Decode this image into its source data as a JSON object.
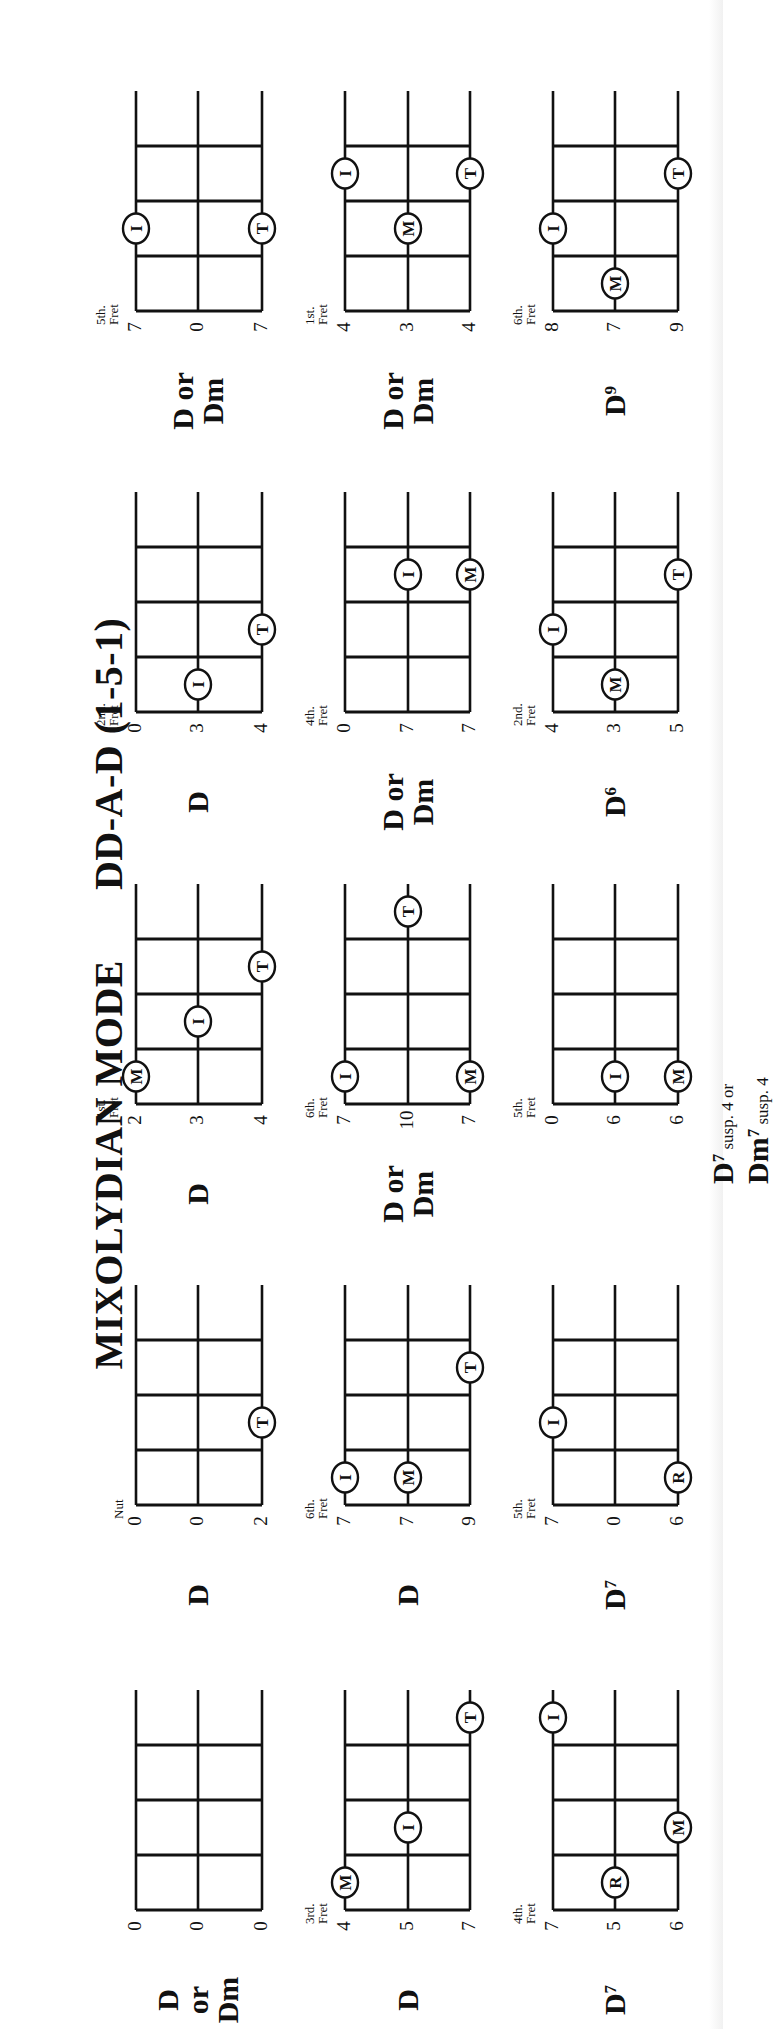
{
  "page": {
    "title_left": "MIXOLYDIAN MODE",
    "title_right": "DD-A-D (1-5-1)",
    "orientation": "rotated-90-ccw"
  },
  "legend": {
    "I": "Index finger",
    "M": "Middle finger",
    "R": "Ring finger",
    "T": "Thumb"
  },
  "diagrams": [
    {
      "row": 0,
      "col": 0,
      "name": "D",
      "name2": "or",
      "name3": "Dm",
      "frets": [
        "0",
        "0",
        "0"
      ],
      "position": "",
      "markers": []
    },
    {
      "row": 0,
      "col": 1,
      "name": "D",
      "frets": [
        "0",
        "0",
        "2"
      ],
      "position": "Nut",
      "markers": [
        {
          "string": 2,
          "fret": 2,
          "finger": "T"
        }
      ]
    },
    {
      "row": 0,
      "col": 2,
      "name": "D",
      "frets": [
        "2",
        "3",
        "4"
      ],
      "position": "1st.\nFret",
      "markers": [
        {
          "string": 0,
          "fret": 1,
          "finger": "M"
        },
        {
          "string": 1,
          "fret": 2,
          "finger": "I"
        },
        {
          "string": 2,
          "fret": 3,
          "finger": "T"
        }
      ]
    },
    {
      "row": 0,
      "col": 3,
      "name": "D",
      "frets": [
        "0",
        "3",
        "4"
      ],
      "position": "2nd.\nFret",
      "markers": [
        {
          "string": 1,
          "fret": 1,
          "finger": "I"
        },
        {
          "string": 2,
          "fret": 2,
          "finger": "T"
        }
      ]
    },
    {
      "row": 0,
      "col": 4,
      "name": "D or",
      "name3": "Dm",
      "frets": [
        "7",
        "0",
        "7"
      ],
      "position": "5th.\nFret",
      "markers": [
        {
          "string": 0,
          "fret": 2,
          "finger": "I"
        },
        {
          "string": 2,
          "fret": 2,
          "finger": "T"
        }
      ]
    },
    {
      "row": 1,
      "col": 0,
      "name": "D",
      "frets": [
        "4",
        "5",
        "7"
      ],
      "position": "3rd.\nFret",
      "markers": [
        {
          "string": 0,
          "fret": 1,
          "finger": "M"
        },
        {
          "string": 1,
          "fret": 2,
          "finger": "I"
        },
        {
          "string": 2,
          "fret": 4,
          "finger": "T"
        }
      ]
    },
    {
      "row": 1,
      "col": 1,
      "name": "D",
      "frets": [
        "7",
        "7",
        "9"
      ],
      "position": "6th.\nFret",
      "markers": [
        {
          "string": 0,
          "fret": 1,
          "finger": "I"
        },
        {
          "string": 1,
          "fret": 1,
          "finger": "M"
        },
        {
          "string": 2,
          "fret": 3,
          "finger": "T"
        }
      ]
    },
    {
      "row": 1,
      "col": 2,
      "name": "D or",
      "name3": "Dm",
      "frets": [
        "7",
        "10",
        "7"
      ],
      "position": "6th.\nFret",
      "markers": [
        {
          "string": 0,
          "fret": 1,
          "finger": "I"
        },
        {
          "string": 2,
          "fret": 1,
          "finger": "M"
        },
        {
          "string": 1,
          "fret": 4,
          "finger": "T"
        }
      ]
    },
    {
      "row": 1,
      "col": 3,
      "name": "D or",
      "name3": "Dm",
      "frets": [
        "0",
        "7",
        "7"
      ],
      "position": "4th.\nFret",
      "markers": [
        {
          "string": 1,
          "fret": 3,
          "finger": "I"
        },
        {
          "string": 2,
          "fret": 3,
          "finger": "M"
        }
      ]
    },
    {
      "row": 1,
      "col": 4,
      "name": "D or",
      "name3": "Dm",
      "frets": [
        "4",
        "3",
        "4"
      ],
      "position": "1st.\nFret",
      "markers": [
        {
          "string": 1,
          "fret": 2,
          "finger": "M"
        },
        {
          "string": 0,
          "fret": 3,
          "finger": "I"
        },
        {
          "string": 2,
          "fret": 3,
          "finger": "T"
        }
      ]
    },
    {
      "row": 2,
      "col": 0,
      "name": "D",
      "sup": "7",
      "frets": [
        "7",
        "5",
        "6"
      ],
      "position": "4th.\nFret",
      "markers": [
        {
          "string": 1,
          "fret": 1,
          "finger": "R"
        },
        {
          "string": 2,
          "fret": 2,
          "finger": "M"
        },
        {
          "string": 0,
          "fret": 4,
          "finger": "I"
        }
      ]
    },
    {
      "row": 2,
      "col": 1,
      "name": "D",
      "sup": "7",
      "frets": [
        "7",
        "0",
        "6"
      ],
      "position": "5th.\nFret",
      "markers": [
        {
          "string": 2,
          "fret": 1,
          "finger": "R"
        },
        {
          "string": 0,
          "fret": 2,
          "finger": "I"
        }
      ]
    },
    {
      "row": 2,
      "col": 2,
      "name": "D",
      "sup": "7",
      "suffix": " susp. 4 or",
      "name3": "Dm",
      "sup3": "7",
      "suffix3": " susp. 4",
      "frets": [
        "0",
        "6",
        "6"
      ],
      "position": "5th.\nFret",
      "markers": [
        {
          "string": 1,
          "fret": 1,
          "finger": "I"
        },
        {
          "string": 2,
          "fret": 1,
          "finger": "M"
        }
      ]
    },
    {
      "row": 2,
      "col": 3,
      "name": "D",
      "sup": "6",
      "frets": [
        "4",
        "3",
        "5"
      ],
      "position": "2nd.\nFret",
      "markers": [
        {
          "string": 1,
          "fret": 1,
          "finger": "M"
        },
        {
          "string": 0,
          "fret": 2,
          "finger": "I"
        },
        {
          "string": 2,
          "fret": 3,
          "finger": "T"
        }
      ]
    },
    {
      "row": 2,
      "col": 4,
      "name": "D",
      "sup": "9",
      "frets": [
        "8",
        "7",
        "9"
      ],
      "position": "6th.\nFret",
      "markers": [
        {
          "string": 1,
          "fret": 1,
          "finger": "M"
        },
        {
          "string": 0,
          "fret": 2,
          "finger": "I"
        },
        {
          "string": 2,
          "fret": 3,
          "finger": "T"
        }
      ]
    }
  ],
  "layout": {
    "col_nut_x": [
      119,
      524,
      925,
      1317,
      1718
    ],
    "row_string_y": [
      [
        136,
        198,
        262
      ],
      [
        345,
        408,
        470
      ],
      [
        553,
        615,
        678
      ]
    ],
    "fret_spacing": 55,
    "string_length": 220
  }
}
